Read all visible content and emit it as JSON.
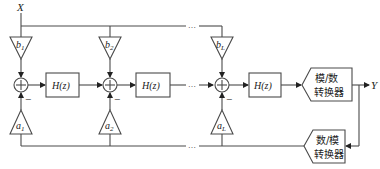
{
  "diagram": {
    "input_label": "X",
    "output_label": "Y",
    "ellipsis": "…",
    "stages": [
      {
        "b_label": "b",
        "b_sub": "1",
        "a_label": "a",
        "a_sub": "1",
        "filter_label": "H(z)",
        "minus_sign": "−"
      },
      {
        "b_label": "b",
        "b_sub": "2",
        "a_label": "a",
        "a_sub": "2",
        "filter_label": "H(z)",
        "minus_sign": "−"
      },
      {
        "b_label": "b",
        "b_sub": "L",
        "a_label": "a",
        "a_sub": "L",
        "filter_label": "H(z)",
        "minus_sign": "−"
      }
    ],
    "adc": {
      "line1": "模/数",
      "line2": "转换器"
    },
    "dac": {
      "line1": "数/模",
      "line2": "转换器"
    },
    "sum_symbol": "+"
  }
}
